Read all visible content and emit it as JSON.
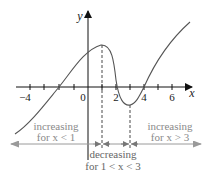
{
  "diagram": {
    "axes": {
      "x_label": "x",
      "y_label": "y",
      "x_tick_labels": [
        {
          "value": -4,
          "text": "−4"
        },
        {
          "value": 0,
          "text": "0"
        },
        {
          "value": 2,
          "text": "2"
        },
        {
          "value": 4,
          "text": "4"
        },
        {
          "value": 6,
          "text": "6"
        }
      ],
      "x_ticks": [
        -4,
        -3,
        -2,
        -1,
        1,
        2,
        3,
        4,
        5,
        6
      ],
      "x_range": [
        -5,
        7
      ]
    },
    "curve": {
      "description": "smooth curve with local maximum at x=1 and local minimum at x=3",
      "local_max_x": 1,
      "local_min_x": 3,
      "x_intercepts": [
        -2,
        2.3,
        3.9
      ],
      "color": "#555555"
    },
    "annotations": {
      "left": {
        "line1": "increasing",
        "line2": "for x < 1"
      },
      "middle": {
        "line1": "decreasing",
        "line2": "for 1 < x < 3"
      },
      "right": {
        "line1": "increasing",
        "line2": "for x > 3"
      }
    },
    "colors": {
      "axis": "#111111",
      "curve": "#555555",
      "annotation_text": "#8a8a8a",
      "annotation_arrow": "#9a9a9a"
    }
  }
}
